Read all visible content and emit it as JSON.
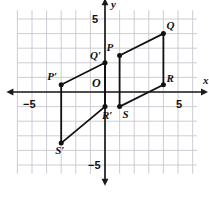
{
  "figure": {
    "title": "",
    "axis_labels": {
      "x": "x",
      "y": "y"
    },
    "tick_labels": {
      "x_neg": "−5",
      "x_pos": "5",
      "y_pos": "5",
      "y_neg": "−5"
    },
    "origin_label": "O",
    "colors": {
      "grid": "#c9c6cf",
      "axis": "#1a1a1a",
      "shape": "#111111",
      "background": "#ffffff"
    }
  },
  "chart_data": {
    "type": "scatter",
    "title": "",
    "xlabel": "x",
    "ylabel": "y",
    "xlim": [
      -6,
      7
    ],
    "ylim": [
      -6,
      6
    ],
    "grid": true,
    "legend": "none",
    "xticks": [
      -5,
      5
    ],
    "yticks": [
      -5,
      5
    ],
    "annotations": [
      "O"
    ],
    "series": [
      {
        "name": "PQRS",
        "closed": true,
        "points": [
          {
            "label": "P",
            "x": 1,
            "y": 2.5,
            "label_dx": -13,
            "label_dy": -14
          },
          {
            "label": "Q",
            "x": 4,
            "y": 4,
            "label_dx": 3,
            "label_dy": -14
          },
          {
            "label": "R",
            "x": 4,
            "y": 0.5,
            "label_dx": 3,
            "label_dy": -12
          },
          {
            "label": "S",
            "x": 1,
            "y": -1,
            "label_dx": 3,
            "label_dy": 2
          }
        ]
      },
      {
        "name": "P'Q'R'S'",
        "closed": true,
        "points": [
          {
            "label": "P′",
            "x": -3,
            "y": 0.5,
            "label_dx": -14,
            "label_dy": -14
          },
          {
            "label": "Q′",
            "x": 0,
            "y": 2,
            "label_dx": -15,
            "label_dy": -13
          },
          {
            "label": "R′",
            "x": 0,
            "y": -1,
            "label_dx": -3,
            "label_dy": 3
          },
          {
            "label": "S′",
            "x": -3,
            "y": -3.5,
            "label_dx": -6,
            "label_dy": 2
          }
        ]
      }
    ]
  }
}
